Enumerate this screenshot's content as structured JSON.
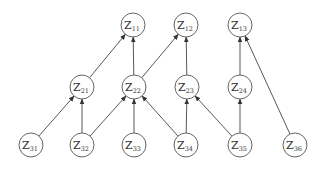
{
  "diagram": {
    "type": "directed-graph",
    "node_radius": 12,
    "colors": {
      "stroke": "#555555",
      "edge": "#444444",
      "text": "#333333",
      "background": "#ffffff"
    },
    "nodes": [
      {
        "id": "Z11",
        "base": "Z",
        "sub": "11",
        "x": 133,
        "y": 25
      },
      {
        "id": "Z12",
        "base": "Z",
        "sub": "12",
        "x": 186,
        "y": 25
      },
      {
        "id": "Z13",
        "base": "Z",
        "sub": "13",
        "x": 240,
        "y": 25
      },
      {
        "id": "Z21",
        "base": "Z",
        "sub": "21",
        "x": 82,
        "y": 87
      },
      {
        "id": "Z22",
        "base": "Z",
        "sub": "22",
        "x": 134,
        "y": 87
      },
      {
        "id": "Z23",
        "base": "Z",
        "sub": "23",
        "x": 187,
        "y": 87
      },
      {
        "id": "Z24",
        "base": "Z",
        "sub": "24",
        "x": 240,
        "y": 87
      },
      {
        "id": "Z31",
        "base": "Z",
        "sub": "31",
        "x": 31,
        "y": 145
      },
      {
        "id": "Z32",
        "base": "Z",
        "sub": "32",
        "x": 82,
        "y": 145
      },
      {
        "id": "Z33",
        "base": "Z",
        "sub": "33",
        "x": 134,
        "y": 145
      },
      {
        "id": "Z34",
        "base": "Z",
        "sub": "34",
        "x": 186,
        "y": 145
      },
      {
        "id": "Z35",
        "base": "Z",
        "sub": "35",
        "x": 240,
        "y": 145
      },
      {
        "id": "Z36",
        "base": "Z",
        "sub": "36",
        "x": 295,
        "y": 145
      }
    ],
    "edges": [
      {
        "from": "Z21",
        "to": "Z11"
      },
      {
        "from": "Z22",
        "to": "Z11"
      },
      {
        "from": "Z22",
        "to": "Z12"
      },
      {
        "from": "Z23",
        "to": "Z12"
      },
      {
        "from": "Z24",
        "to": "Z13"
      },
      {
        "from": "Z36",
        "to": "Z13"
      },
      {
        "from": "Z31",
        "to": "Z21"
      },
      {
        "from": "Z32",
        "to": "Z21"
      },
      {
        "from": "Z32",
        "to": "Z22"
      },
      {
        "from": "Z33",
        "to": "Z22"
      },
      {
        "from": "Z34",
        "to": "Z22"
      },
      {
        "from": "Z34",
        "to": "Z23"
      },
      {
        "from": "Z35",
        "to": "Z23"
      },
      {
        "from": "Z35",
        "to": "Z24"
      }
    ]
  }
}
